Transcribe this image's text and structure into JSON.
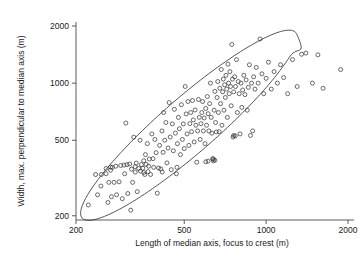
{
  "chart_data": {
    "type": "scatter",
    "title": "",
    "xlabel": "Length of median axis, focus to crest (m)",
    "ylabel": "Width, max. perpendicular to median axis (m)",
    "xscale": "log",
    "yscale": "log",
    "xlim": [
      200,
      2000
    ],
    "ylim": [
      190,
      2100
    ],
    "xticks": [
      200,
      500,
      1000,
      2000
    ],
    "yticks": [
      200,
      500,
      1000,
      2000
    ],
    "xtick_labels": [
      "200",
      "500",
      "1000",
      "2000"
    ],
    "ytick_labels": [
      "200",
      "500",
      "1000",
      "2000"
    ],
    "grid": false,
    "legend": "none",
    "marker": "open-circle",
    "marker_color": "#3a3a3a",
    "marker_size_px": 3.0,
    "annotations": [
      {
        "name": "confidence-ellipse",
        "type": "ellipse-contour",
        "center_x": 520,
        "center_y": 600,
        "semi_major_log": 0.52,
        "semi_minor_log": 0.145,
        "angle_deg": -41,
        "stroke": "#2b2b2b",
        "note": "tilted contour with small notch near upper-right"
      }
    ],
    "points": [
      [
        222,
        228
      ],
      [
        236,
        330
      ],
      [
        240,
        258
      ],
      [
        248,
        330
      ],
      [
        247,
        287
      ],
      [
        258,
        333
      ],
      [
        262,
        235
      ],
      [
        264,
        300
      ],
      [
        268,
        361
      ],
      [
        270,
        252
      ],
      [
        272,
        360
      ],
      [
        276,
        300
      ],
      [
        280,
        365
      ],
      [
        282,
        258
      ],
      [
        288,
        302
      ],
      [
        292,
        368
      ],
      [
        296,
        246
      ],
      [
        300,
        370
      ],
      [
        302,
        333
      ],
      [
        305,
        616
      ],
      [
        308,
        372
      ],
      [
        310,
        262
      ],
      [
        315,
        375
      ],
      [
        318,
        214
      ],
      [
        320,
        352
      ],
      [
        323,
        300
      ],
      [
        326,
        519
      ],
      [
        330,
        363
      ],
      [
        333,
        379
      ],
      [
        336,
        268
      ],
      [
        340,
        355
      ],
      [
        344,
        500
      ],
      [
        348,
        372
      ],
      [
        352,
        356
      ],
      [
        355,
        390
      ],
      [
        358,
        330
      ],
      [
        360,
        420
      ],
      [
        362,
        373
      ],
      [
        366,
        480
      ],
      [
        370,
        365
      ],
      [
        372,
        398
      ],
      [
        376,
        330
      ],
      [
        380,
        540
      ],
      [
        384,
        400
      ],
      [
        386,
        360
      ],
      [
        390,
        505
      ],
      [
        394,
        430
      ],
      [
        398,
        263
      ],
      [
        402,
        357
      ],
      [
        406,
        470
      ],
      [
        410,
        353
      ],
      [
        414,
        560
      ],
      [
        418,
        432
      ],
      [
        420,
        700
      ],
      [
        424,
        500
      ],
      [
        428,
        620
      ],
      [
        432,
        380
      ],
      [
        436,
        455
      ],
      [
        440,
        790
      ],
      [
        444,
        520
      ],
      [
        448,
        350
      ],
      [
        452,
        610
      ],
      [
        456,
        440
      ],
      [
        460,
        728
      ],
      [
        464,
        545
      ],
      [
        468,
        333
      ],
      [
        472,
        480
      ],
      [
        476,
        660
      ],
      [
        480,
        575
      ],
      [
        484,
        420
      ],
      [
        488,
        770
      ],
      [
        492,
        505
      ],
      [
        496,
        610
      ],
      [
        500,
        452
      ],
      [
        504,
        960
      ],
      [
        508,
        688
      ],
      [
        512,
        540
      ],
      [
        516,
        800
      ],
      [
        520,
        470
      ],
      [
        524,
        612
      ],
      [
        528,
        700
      ],
      [
        532,
        555
      ],
      [
        536,
        810
      ],
      [
        540,
        640
      ],
      [
        544,
        490
      ],
      [
        548,
        722
      ],
      [
        552,
        600
      ],
      [
        556,
        383
      ],
      [
        560,
        560
      ],
      [
        564,
        820
      ],
      [
        568,
        660
      ],
      [
        572,
        505
      ],
      [
        576,
        612
      ],
      [
        580,
        700
      ],
      [
        584,
        800
      ],
      [
        588,
        560
      ],
      [
        592,
        655
      ],
      [
        596,
        480
      ],
      [
        600,
        735
      ],
      [
        604,
        600
      ],
      [
        608,
        850
      ],
      [
        612,
        690
      ],
      [
        616,
        560
      ],
      [
        620,
        780
      ],
      [
        624,
        1000
      ],
      [
        628,
        660
      ],
      [
        632,
        545
      ],
      [
        636,
        400
      ],
      [
        640,
        398
      ],
      [
        644,
        720
      ],
      [
        648,
        905
      ],
      [
        652,
        620
      ],
      [
        656,
        553
      ],
      [
        660,
        840
      ],
      [
        664,
        1020
      ],
      [
        668,
        700
      ],
      [
        672,
        555
      ],
      [
        676,
        940
      ],
      [
        680,
        780
      ],
      [
        684,
        1180
      ],
      [
        688,
        600
      ],
      [
        692,
        900
      ],
      [
        696,
        1050
      ],
      [
        700,
        720
      ],
      [
        704,
        980
      ],
      [
        708,
        840
      ],
      [
        712,
        1100
      ],
      [
        716,
        930
      ],
      [
        720,
        660
      ],
      [
        724,
        1260
      ],
      [
        728,
        1000
      ],
      [
        732,
        880
      ],
      [
        736,
        1150
      ],
      [
        740,
        960
      ],
      [
        744,
        760
      ],
      [
        748,
        1600
      ],
      [
        752,
        1050
      ],
      [
        756,
        520
      ],
      [
        760,
        900
      ],
      [
        766,
        1080
      ],
      [
        772,
        960
      ],
      [
        778,
        1330
      ],
      [
        784,
        700
      ],
      [
        790,
        1020
      ],
      [
        796,
        880
      ],
      [
        802,
        540
      ],
      [
        808,
        1000
      ],
      [
        814,
        745
      ],
      [
        820,
        920
      ],
      [
        828,
        1100
      ],
      [
        836,
        870
      ],
      [
        844,
        1040
      ],
      [
        852,
        720
      ],
      [
        860,
        950
      ],
      [
        868,
        1250
      ],
      [
        876,
        530
      ],
      [
        884,
        1000
      ],
      [
        892,
        560
      ],
      [
        900,
        1080
      ],
      [
        910,
        930
      ],
      [
        920,
        1210
      ],
      [
        935,
        1000
      ],
      [
        950,
        1710
      ],
      [
        965,
        1120
      ],
      [
        980,
        880
      ],
      [
        1000,
        1060
      ],
      [
        1020,
        1290
      ],
      [
        1045,
        930
      ],
      [
        1070,
        1150
      ],
      [
        1100,
        1000
      ],
      [
        1130,
        1250
      ],
      [
        1160,
        1070
      ],
      [
        1200,
        880
      ],
      [
        1250,
        1330
      ],
      [
        1300,
        960
      ],
      [
        1350,
        1420
      ],
      [
        1400,
        1440
      ],
      [
        1480,
        1000
      ],
      [
        1550,
        1410
      ],
      [
        1620,
        940
      ],
      [
        1880,
        1180
      ],
      [
        330,
        340
      ],
      [
        345,
        344
      ],
      [
        355,
        338
      ],
      [
        368,
        342
      ],
      [
        258,
        355
      ],
      [
        268,
        348
      ],
      [
        600,
        385
      ],
      [
        612,
        388
      ],
      [
        415,
        340
      ],
      [
        470,
        360
      ],
      [
        640,
        390
      ],
      [
        648,
        392
      ],
      [
        760,
        530
      ],
      [
        770,
        527
      ]
    ]
  }
}
